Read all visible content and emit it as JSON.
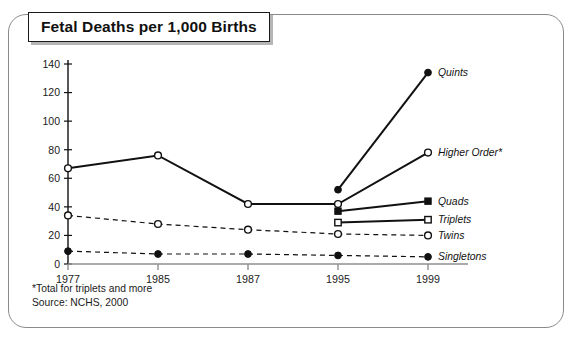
{
  "title": "Fetal Deaths per 1,000 Births",
  "footnotes": {
    "asterisk": "*Total for triplets and more",
    "source": "Source: NCHS, 2000"
  },
  "axis": {
    "y_ticks": [
      "0",
      "20",
      "40",
      "60",
      "80",
      "100",
      "120",
      "140"
    ],
    "x_ticks": [
      "1977",
      "1985",
      "1987",
      "1995",
      "1999"
    ]
  },
  "labels": {
    "quints": "Quints",
    "higher_order": "Higher Order*",
    "quads": "Quads",
    "triplets": "Triplets",
    "twins": "Twins",
    "singletons": "Singletons"
  },
  "chart_data": {
    "type": "line",
    "title": "Fetal Deaths per 1,000 Births",
    "xlabel": "",
    "ylabel": "",
    "ylim": [
      0,
      140
    ],
    "yticks": [
      0,
      20,
      40,
      60,
      80,
      100,
      120,
      140
    ],
    "grid": false,
    "legend_position": "right-inline",
    "categories": [
      "1977",
      "1985",
      "1987",
      "1995",
      "1999"
    ],
    "annotations": [
      "*Total for triplets and more",
      "Source: NCHS, 2000"
    ],
    "series": [
      {
        "name": "Quints",
        "marker": "filled-circle",
        "linestyle": "solid",
        "x": [
          "1995",
          "1999"
        ],
        "values": [
          52,
          134
        ]
      },
      {
        "name": "Higher Order*",
        "marker": "open-circle",
        "linestyle": "solid",
        "x": [
          "1977",
          "1985",
          "1987",
          "1995",
          "1999"
        ],
        "values": [
          67,
          76,
          42,
          42,
          78
        ]
      },
      {
        "name": "Quads",
        "marker": "filled-square",
        "linestyle": "solid",
        "x": [
          "1995",
          "1999"
        ],
        "values": [
          37,
          44
        ]
      },
      {
        "name": "Triplets",
        "marker": "open-square",
        "linestyle": "solid",
        "x": [
          "1995",
          "1999"
        ],
        "values": [
          29,
          31
        ]
      },
      {
        "name": "Twins",
        "marker": "open-circle",
        "linestyle": "dashed",
        "x": [
          "1977",
          "1985",
          "1987",
          "1995",
          "1999"
        ],
        "values": [
          34,
          28,
          24,
          21,
          20
        ]
      },
      {
        "name": "Singletons",
        "marker": "filled-circle",
        "linestyle": "dashed",
        "x": [
          "1977",
          "1985",
          "1987",
          "1995",
          "1999"
        ],
        "values": [
          9,
          7,
          7,
          6,
          5
        ]
      }
    ]
  }
}
